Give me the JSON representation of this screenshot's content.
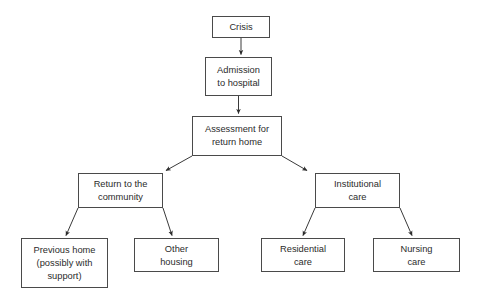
{
  "diagram": {
    "type": "flowchart",
    "title": "",
    "orientation": "top-down",
    "background_color": "#ffffff",
    "box_border_color": "#4a4a4a",
    "box_fill_color": "#ffffff",
    "text_color": "#2b2b2b",
    "arrow_color": "#3a3a3a",
    "nodes": [
      {
        "id": "crisis",
        "label": "Crisis",
        "lines": [
          "Crisis"
        ],
        "x": 212,
        "y": 16,
        "w": 58,
        "h": 22,
        "level": 0
      },
      {
        "id": "admission",
        "label": "Admission to hospital",
        "lines": [
          "Admission",
          "to hospital"
        ],
        "x": 205,
        "y": 57,
        "w": 67,
        "h": 39,
        "level": 1
      },
      {
        "id": "assessment",
        "label": "Assessment for return home",
        "lines": [
          "Assessment for",
          "return home"
        ],
        "x": 192,
        "y": 116,
        "w": 90,
        "h": 40,
        "level": 2
      },
      {
        "id": "community",
        "label": "Return to the community",
        "lines": [
          "Return to the",
          "community"
        ],
        "x": 78,
        "y": 173,
        "w": 85,
        "h": 35,
        "level": 3
      },
      {
        "id": "institutional",
        "label": "Institutional care",
        "lines": [
          "Institutional",
          "care"
        ],
        "x": 315,
        "y": 173,
        "w": 85,
        "h": 35,
        "level": 3
      },
      {
        "id": "previous-home",
        "label": "Previous home (possibly with support)",
        "lines": [
          "Previous home",
          "(possibly with",
          "support)"
        ],
        "x": 21,
        "y": 238,
        "w": 87,
        "h": 50,
        "level": 4
      },
      {
        "id": "other-housing",
        "label": "Other housing",
        "lines": [
          "Other",
          "housing"
        ],
        "x": 134,
        "y": 238,
        "w": 85,
        "h": 34,
        "level": 4
      },
      {
        "id": "residential-care",
        "label": "Residential care",
        "lines": [
          "Residential",
          "care"
        ],
        "x": 261,
        "y": 238,
        "w": 84,
        "h": 34,
        "level": 4
      },
      {
        "id": "nursing-care",
        "label": "Nursing care",
        "lines": [
          "Nursing",
          "care"
        ],
        "x": 373,
        "y": 238,
        "w": 87,
        "h": 34,
        "level": 4
      }
    ],
    "edges": [
      {
        "from": "crisis",
        "to": "admission",
        "kind": "straight-down",
        "arrowhead": true
      },
      {
        "from": "admission",
        "to": "assessment",
        "kind": "straight-down",
        "arrowhead": true
      },
      {
        "from": "assessment",
        "to": "community",
        "kind": "diagonal-left",
        "arrowhead": true
      },
      {
        "from": "assessment",
        "to": "institutional",
        "kind": "diagonal-right",
        "arrowhead": true
      },
      {
        "from": "community",
        "to": "previous-home",
        "kind": "diagonal-left",
        "arrowhead": true
      },
      {
        "from": "community",
        "to": "other-housing",
        "kind": "diagonal-right",
        "arrowhead": true
      },
      {
        "from": "institutional",
        "to": "residential-care",
        "kind": "diagonal-left",
        "arrowhead": true
      },
      {
        "from": "institutional",
        "to": "nursing-care",
        "kind": "diagonal-right",
        "arrowhead": true
      }
    ]
  }
}
